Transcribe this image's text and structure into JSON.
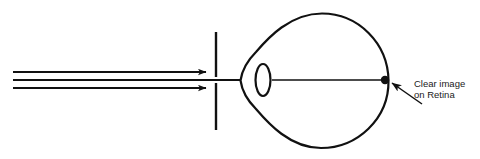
{
  "diagram": {
    "name": "normal-vision-eye-ray-diagram",
    "background_color": "#ffffff",
    "stroke_color": "#111111",
    "width": 480,
    "height": 159,
    "annotations": {
      "retina_label_line1": "Clear image",
      "retina_label_line2": "on Retina"
    },
    "parts": {
      "incoming_rays_label": "parallel light rays",
      "barrier_label": "aperture barrier",
      "cornea_label": "cornea",
      "lens_label": "lens",
      "eyeball_label": "eyeball outline",
      "optical_axis_label": "optical axis",
      "focal_point_label": "focal point on retina",
      "callout_arrow_label": "callout arrow"
    },
    "geometry": {
      "ray_y_top": 72,
      "ray_y_mid": 80,
      "ray_y_bottom": 88,
      "ray_x_start": 13,
      "barrier_x": 216,
      "lens_cx": 263,
      "lens_cy": 80,
      "focal_dot_x": 385,
      "focal_dot_y": 80,
      "text_x": 414,
      "text_y1": 87,
      "text_y2": 98
    }
  }
}
